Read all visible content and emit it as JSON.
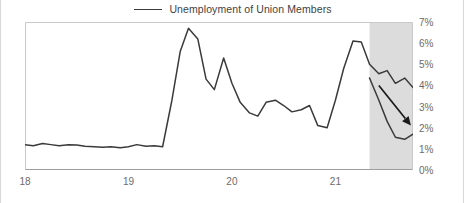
{
  "legend": {
    "label": "Unemployment of Union Members",
    "swatch_color": "#3a3a3a"
  },
  "axes": {
    "y_ticks": [
      "0%",
      "1%",
      "2%",
      "3%",
      "4%",
      "5%",
      "6%",
      "7%"
    ],
    "x_ticks": [
      "18",
      "19",
      "20",
      "21"
    ]
  },
  "chart_data": {
    "type": "line",
    "title": "",
    "xlabel": "",
    "ylabel": "",
    "ylim": [
      0,
      7
    ],
    "xlim": [
      2018.0,
      2021.75
    ],
    "grid": false,
    "legend_position": "top-center",
    "y_tick_values": [
      0,
      1,
      2,
      3,
      4,
      5,
      6,
      7
    ],
    "y_tick_labels": [
      "0%",
      "1%",
      "2%",
      "3%",
      "4%",
      "5%",
      "6%",
      "7%"
    ],
    "x_tick_values": [
      2018,
      2019,
      2020,
      2021
    ],
    "x_tick_labels": [
      "18",
      "19",
      "20",
      "21"
    ],
    "line_color": "#3a3a3a",
    "series": [
      {
        "name": "Unemployment of Union Members",
        "x": [
          2018.0,
          2018.08,
          2018.17,
          2018.25,
          2018.33,
          2018.42,
          2018.5,
          2018.58,
          2018.67,
          2018.75,
          2018.83,
          2018.92,
          2019.0,
          2019.08,
          2019.17,
          2019.25,
          2019.33,
          2019.42,
          2019.5,
          2019.58,
          2019.67,
          2019.75,
          2019.83,
          2019.92,
          2020.0,
          2020.08,
          2020.17,
          2020.25,
          2020.33,
          2020.42,
          2020.5,
          2020.58,
          2020.67,
          2020.75,
          2020.83,
          2020.92,
          2021.0,
          2021.08,
          2021.17,
          2021.25,
          2021.33,
          2021.42,
          2021.5,
          2021.58,
          2021.67,
          2021.75
        ],
        "values": [
          1.2,
          1.15,
          1.25,
          1.2,
          1.15,
          1.2,
          1.18,
          1.12,
          1.1,
          1.08,
          1.1,
          1.05,
          1.1,
          1.2,
          1.12,
          1.15,
          1.1,
          3.3,
          5.6,
          6.7,
          6.2,
          4.3,
          3.8,
          5.3,
          4.1,
          3.2,
          2.7,
          2.55,
          3.2,
          3.3,
          3.05,
          2.75,
          2.85,
          3.05,
          2.1,
          2.0,
          3.3,
          4.8,
          6.1,
          6.05,
          5.0,
          4.55,
          4.7,
          4.1,
          4.35,
          3.9
        ]
      }
    ],
    "shaded_region": {
      "label": "forecast",
      "x_start": 2021.33,
      "x_end": 2021.75,
      "color": "#dcdcdc"
    },
    "annotations": [
      {
        "type": "arrow",
        "label": "declining-trend-arrow",
        "x_start": 2021.42,
        "y_start": 4.0,
        "x_end": 2021.73,
        "y_end": 2.1,
        "color": "#1a1a1a"
      },
      {
        "type": "projection_line",
        "label": "forecast-path",
        "x": [
          2021.33,
          2021.42,
          2021.5,
          2021.58,
          2021.67,
          2021.75
        ],
        "values": [
          4.35,
          3.3,
          2.3,
          1.55,
          1.45,
          1.7
        ]
      }
    ]
  }
}
